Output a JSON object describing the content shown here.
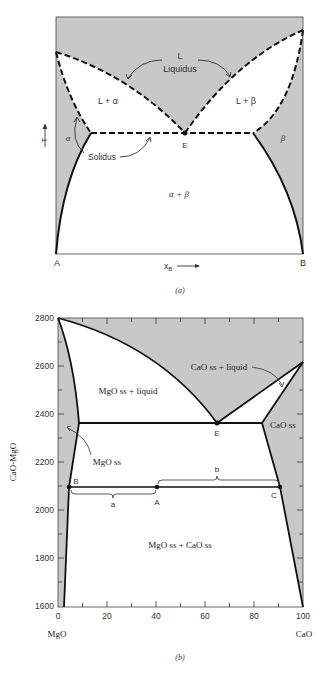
{
  "diagram_a": {
    "caption": "(a)",
    "regions": {
      "liquid": "L",
      "liquidus": "Liquidus",
      "l_alpha": "L + α",
      "l_beta": "L + β",
      "alpha": "α",
      "beta": "β",
      "alpha_beta": "α + β",
      "solidus": "Solidus"
    },
    "points": {
      "eutectic": "E"
    },
    "axis": {
      "left_end": "A",
      "right_end": "B",
      "xlabel": "x",
      "xlabel_sub": "B",
      "ylabel": "T"
    }
  },
  "diagram_b": {
    "caption": "(b)",
    "ylabel": "CaO-MgO",
    "yticks": [
      "2800",
      "2600",
      "2400",
      "2200",
      "2000",
      "1800",
      "1600"
    ],
    "xticks": [
      "0",
      "20",
      "40",
      "60",
      "80",
      "100"
    ],
    "x_left_label": "MgO",
    "x_right_label": "CaO",
    "regions": {
      "mgo_liquid": "MgO ss + liquid",
      "cao_liquid": "CaO ss + liquid",
      "mgo_ss": "MgO ss",
      "cao_ss": "CaO ss",
      "two_solid": "MgO ss + CaO ss"
    },
    "points": {
      "eutectic": "E",
      "B": "B",
      "A": "A",
      "C": "C"
    },
    "lever": {
      "a": "a",
      "b": "b"
    }
  },
  "colors": {
    "shade": "#c8c8c8",
    "line": "#111111",
    "text": "#333333"
  }
}
